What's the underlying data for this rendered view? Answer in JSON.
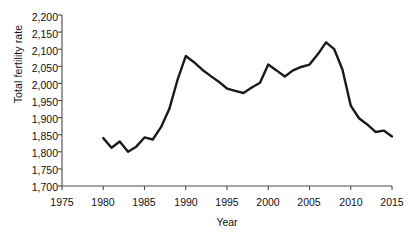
{
  "chart_data": {
    "type": "line",
    "title": "",
    "xlabel": "Year",
    "ylabel": "Total fertility rate",
    "xlim": [
      1975,
      2015
    ],
    "ylim": [
      1700,
      2200
    ],
    "grid": false,
    "legend": "none",
    "line_color": "#1a1a1a",
    "x_ticks": [
      "1975",
      "1980",
      "1985",
      "1990",
      "1995",
      "2000",
      "2005",
      "2010",
      "2015"
    ],
    "y_ticks": [
      "1,700",
      "1,750",
      "1,800",
      "1,850",
      "1,900",
      "1,950",
      "2,000",
      "2,050",
      "2,100",
      "2,150",
      "2,200"
    ],
    "x": [
      1980,
      1981,
      1982,
      1983,
      1984,
      1985,
      1986,
      1987,
      1988,
      1989,
      1990,
      1991,
      1992,
      1993,
      1994,
      1995,
      1996,
      1997,
      1998,
      1999,
      2000,
      2001,
      2002,
      2003,
      2004,
      2005,
      2006,
      2007,
      2008,
      2009,
      2010,
      2011,
      2012,
      2013,
      2014,
      2015
    ],
    "series": [
      {
        "name": "Total fertility rate",
        "values": [
          1840,
          1812,
          1830,
          1800,
          1815,
          1842,
          1836,
          1872,
          1925,
          2010,
          2080,
          2062,
          2040,
          2022,
          2005,
          1985,
          1978,
          1972,
          1988,
          2002,
          2055,
          2038,
          2020,
          2038,
          2048,
          2055,
          2085,
          2120,
          2100,
          2040,
          1935,
          1898,
          1880,
          1858,
          1862,
          1845
        ]
      }
    ]
  },
  "axis": {
    "y_title": "Total fertility rate",
    "x_title": "Year"
  }
}
